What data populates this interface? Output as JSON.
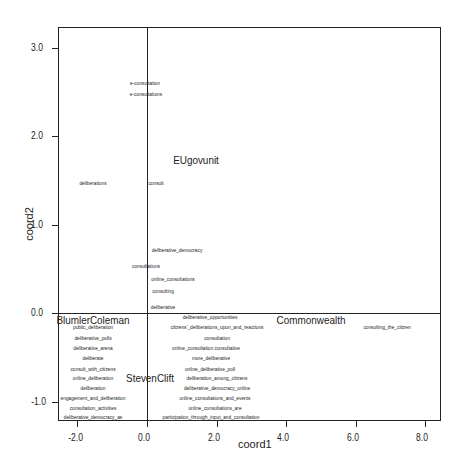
{
  "chart_data": {
    "type": "scatter",
    "title": "",
    "xlabel": "coord1",
    "ylabel": "coord2",
    "xlim": [
      -2.6,
      8.5
    ],
    "ylim": [
      -1.25,
      3.22
    ],
    "grid": false,
    "reference_lines": {
      "x": 0.0,
      "y": 0.0
    },
    "x_ticks": [
      -2.0,
      0.0,
      2.0,
      4.0,
      6.0,
      8.0
    ],
    "x_tick_labels": [
      "-2.0",
      "0.0",
      "2.0",
      "4.0",
      "6.0",
      "8.0"
    ],
    "y_ticks": [
      3.0,
      2.0,
      1.0,
      0.0,
      -1.0
    ],
    "y_tick_labels": [
      "3.0",
      "2.0",
      "1.0",
      "0.0",
      "-1.0"
    ],
    "points": [
      {
        "label": "e-consultation",
        "x": -0.06,
        "y": 2.6,
        "kind": "word"
      },
      {
        "label": "e-consultations",
        "x": -0.03,
        "y": 2.48,
        "kind": "word"
      },
      {
        "label": "EUgovunit",
        "x": 1.4,
        "y": 1.73,
        "kind": "group"
      },
      {
        "label": "deliberations",
        "x": -1.55,
        "y": 1.47,
        "kind": "word"
      },
      {
        "label": "consult",
        "x": 0.25,
        "y": 1.47,
        "kind": "word"
      },
      {
        "label": "deliberative_democracy",
        "x": 0.85,
        "y": 0.71,
        "kind": "word"
      },
      {
        "label": "consultations",
        "x": -0.03,
        "y": 0.53,
        "kind": "word"
      },
      {
        "label": "online_consultations",
        "x": 0.75,
        "y": 0.38,
        "kind": "word"
      },
      {
        "label": "consulting",
        "x": 0.45,
        "y": 0.25,
        "kind": "word"
      },
      {
        "label": "deliberative",
        "x": 0.45,
        "y": 0.07,
        "kind": "word"
      },
      {
        "label": "BlumlerColeman",
        "x": -1.55,
        "y": -0.08,
        "kind": "group"
      },
      {
        "label": "deliberative_opportunities",
        "x": 1.8,
        "y": -0.04,
        "kind": "word"
      },
      {
        "label": "Commonwealth",
        "x": 4.7,
        "y": -0.08,
        "kind": "group"
      },
      {
        "label": "consulting_the_citizen",
        "x": 6.9,
        "y": -0.16,
        "kind": "word"
      },
      {
        "label": "public_deliberation",
        "x": -1.55,
        "y": -0.16,
        "kind": "word"
      },
      {
        "label": "citizens'_deliberations_upon_and_reactions",
        "x": 2.0,
        "y": -0.16,
        "kind": "word"
      },
      {
        "label": "deliberative_polls",
        "x": -1.55,
        "y": -0.28,
        "kind": "word"
      },
      {
        "label": "consultation",
        "x": 2.0,
        "y": -0.28,
        "kind": "word"
      },
      {
        "label": "deliberative_arena",
        "x": -1.55,
        "y": -0.4,
        "kind": "word"
      },
      {
        "label": "online_consultation consultative",
        "x": 1.7,
        "y": -0.4,
        "kind": "word"
      },
      {
        "label": "deliberate",
        "x": -1.55,
        "y": -0.51,
        "kind": "word"
      },
      {
        "label": "more_deliberative",
        "x": 1.85,
        "y": -0.51,
        "kind": "word"
      },
      {
        "label": "consult_with_citizens",
        "x": -1.55,
        "y": -0.63,
        "kind": "word"
      },
      {
        "label": "online_deliberative_poll",
        "x": 1.8,
        "y": -0.63,
        "kind": "word"
      },
      {
        "label": "online_deliberation",
        "x": -1.55,
        "y": -0.74,
        "kind": "word"
      },
      {
        "label": "StevenClift",
        "x": 0.1,
        "y": -0.74,
        "kind": "group"
      },
      {
        "label": "deliberation_among_citizens",
        "x": 2.0,
        "y": -0.74,
        "kind": "word"
      },
      {
        "label": "deliberation",
        "x": -1.55,
        "y": -0.85,
        "kind": "word"
      },
      {
        "label": "deliberative_democracy_online",
        "x": 2.0,
        "y": -0.85,
        "kind": "word"
      },
      {
        "label": "engagement_and_deliberation",
        "x": -1.55,
        "y": -0.96,
        "kind": "word"
      },
      {
        "label": "online_consultations_and_events",
        "x": 1.95,
        "y": -0.96,
        "kind": "word"
      },
      {
        "label": "consultation_activities",
        "x": -1.55,
        "y": -1.07,
        "kind": "word"
      },
      {
        "label": "online_consultations_are",
        "x": 1.95,
        "y": -1.07,
        "kind": "word"
      },
      {
        "label": "deliberative_democracy_as",
        "x": -1.55,
        "y": -1.18,
        "kind": "word"
      },
      {
        "label": "participation_through_input_and_consultation",
        "x": 1.85,
        "y": -1.18,
        "kind": "word"
      }
    ]
  }
}
